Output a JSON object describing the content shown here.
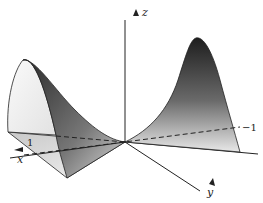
{
  "figure": {
    "axes": {
      "z_label": "z",
      "x_label": "x",
      "y_label": "y"
    },
    "ticks": {
      "x_tick": "1",
      "y_tick": "−1"
    },
    "colors": {
      "axis": "#222222",
      "surface_dark": "#2a2a2a",
      "surface_light": "#f2f2f2",
      "background": "#ffffff"
    }
  }
}
